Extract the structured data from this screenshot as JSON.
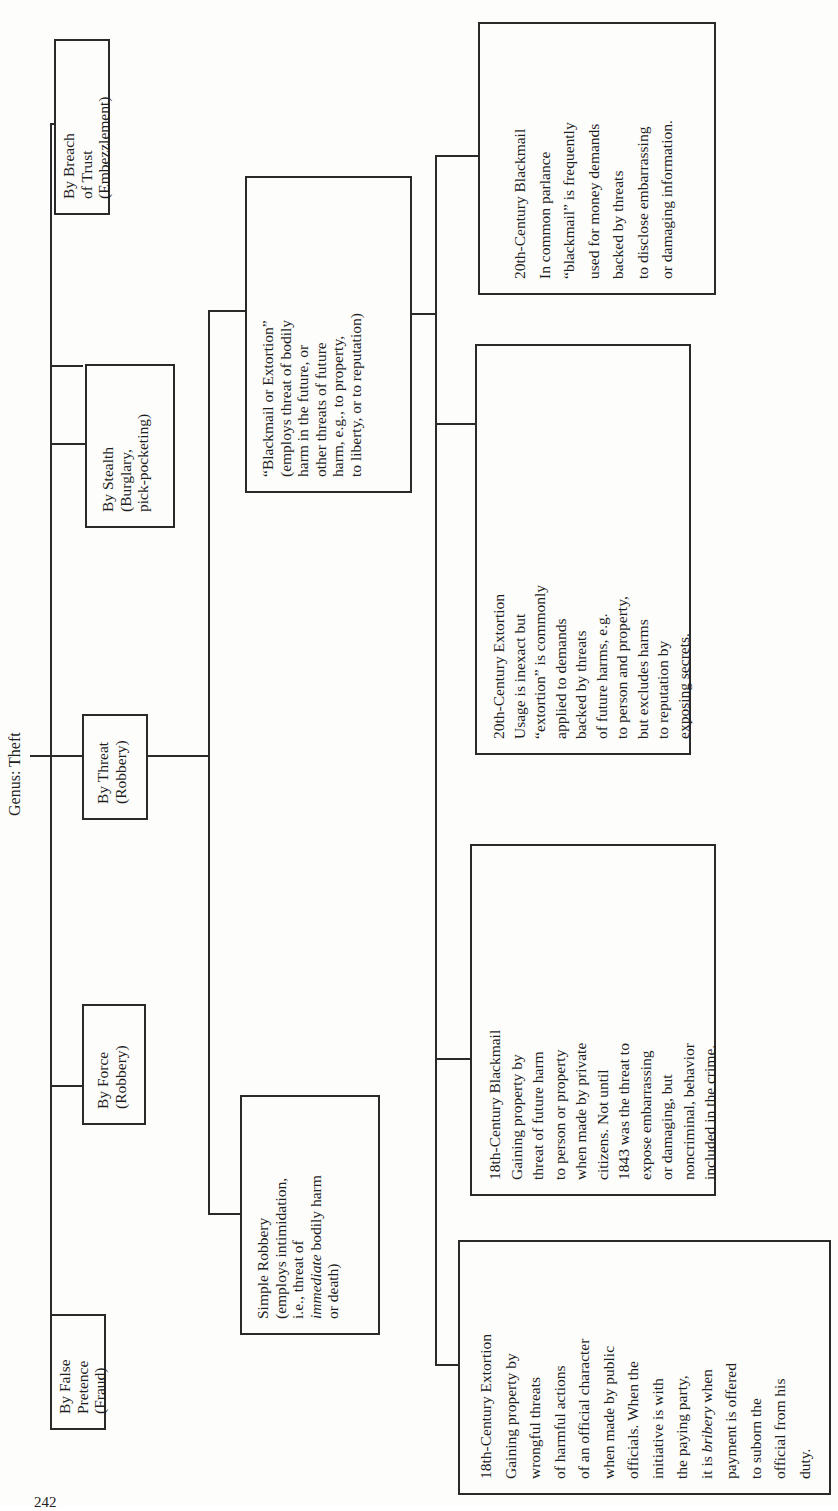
{
  "diagram": {
    "root": {
      "label": "Genus:  Theft"
    },
    "level1": [
      {
        "id": "false-pretence",
        "lines": [
          "By False",
          "Pretence",
          "(Fraud)"
        ]
      },
      {
        "id": "force",
        "lines": [
          "By Force",
          "(Robbery)"
        ]
      },
      {
        "id": "threat",
        "lines": [
          "By Threat",
          "(Robbery)"
        ]
      },
      {
        "id": "stealth",
        "lines": [
          "By Stealth",
          "(Burglary,",
          "pick-pocketing)"
        ]
      },
      {
        "id": "breach-of-trust",
        "lines": [
          "By Breach",
          "of Trust",
          "(Embezzlement)"
        ]
      }
    ],
    "level2": [
      {
        "id": "simple-robbery",
        "lines": [
          "Simple Robbery",
          "(employs intimidation,",
          "i.e., threat of",
          "bodily harm",
          "or death)"
        ],
        "italic_prefix_line_index": 3,
        "italic_prefix": "immediate"
      },
      {
        "id": "blackmail-or-extortion",
        "lines": [
          "“Blackmail or Extortion”",
          "(employs threat of bodily",
          "harm in the future, or",
          "other threats of future",
          "harm, e.g., to property,",
          "to liberty, or to reputation)"
        ]
      }
    ],
    "level3": [
      {
        "id": "c18-extortion",
        "lines": [
          "18th-Century Extortion",
          "Gaining property by",
          "wrongful threats",
          "of harmful actions",
          "of an official character",
          "when made by public",
          "officials. When the",
          "initiative is with",
          "the paying party,",
          "it is",
          "payment is offered",
          "to suborn the",
          "official from his",
          "duty."
        ],
        "italic_word_line_index": 9,
        "italic_word": "bribery",
        "italic_suffix": " when"
      },
      {
        "id": "c18-blackmail",
        "lines": [
          "18th-Century Blackmail",
          "Gaining property by",
          "threat of future harm",
          "to person or property",
          "when made by private",
          "citizens. Not until",
          "1843 was the threat to",
          "expose embarrassing",
          "or damaging, but",
          "noncriminal, behavior",
          "included in the crime."
        ]
      },
      {
        "id": "c20-extortion",
        "lines": [
          "20th-Century Extortion",
          "Usage is inexact but",
          "“extortion” is commonly",
          "applied to demands",
          "backed by threats",
          "of future harms, e.g.",
          "to person and property,",
          "but excludes harms",
          "to reputation by",
          "exposing secrets."
        ]
      },
      {
        "id": "c20-blackmail",
        "lines": [
          "20th-Century Blackmail",
          "In common parlance",
          "“blackmail” is frequently",
          "used for money demands",
          "backed by threats",
          "to disclose embarrassing",
          "or damaging information."
        ]
      }
    ]
  },
  "page": {
    "number": "242"
  }
}
